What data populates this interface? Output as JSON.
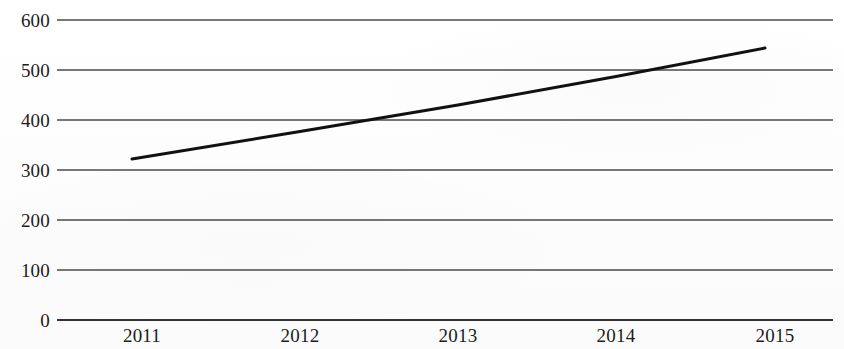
{
  "chart_data": {
    "type": "line",
    "title": "",
    "subtitle": "",
    "xlabel": "",
    "ylabel": "",
    "categories": [
      "2011",
      "2012",
      "2013",
      "2014",
      "2015"
    ],
    "series": [
      {
        "name": "",
        "values": [
          322,
          377,
          430,
          487,
          544
        ],
        "color": "#111111",
        "line_width": 3,
        "markers": false
      }
    ],
    "x_tick_labels": [
      "2011",
      "2012",
      "2013",
      "2014",
      "2015"
    ],
    "y_tick_labels": [
      "0",
      "100",
      "200",
      "300",
      "400",
      "500",
      "600"
    ],
    "y_ticks": [
      0,
      100,
      200,
      300,
      400,
      500,
      600
    ],
    "ylim": [
      0,
      600
    ],
    "grid": true,
    "grid_axis": "y",
    "grid_color": "#4a4a4a",
    "legend": false,
    "legend_position": "none",
    "background_color": "#fefefe",
    "axis_color": "#333333"
  },
  "axes": {
    "y_labels": [
      "600",
      "500",
      "400",
      "300",
      "200",
      "100",
      "0"
    ],
    "x_labels": [
      "2011",
      "2012",
      "2013",
      "2014",
      "2015"
    ]
  }
}
